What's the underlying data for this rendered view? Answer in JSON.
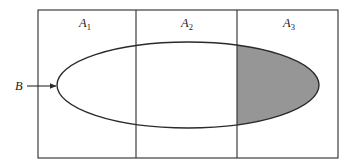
{
  "figure": {
    "type": "venn-partition-diagram",
    "background_color": "#ffffff",
    "stroke_color": "#2b2b2b",
    "shaded_color": "#969696"
  },
  "universe_rect": {
    "name": "universal-set-rectangle",
    "x": 38,
    "y": 10,
    "width": 300,
    "height": 148
  },
  "partitions": [
    {
      "id": "A1",
      "label": "A",
      "subscript": "1",
      "label_x": 85,
      "label_y": 27,
      "region_x": 38,
      "region_width": 98
    },
    {
      "id": "A2",
      "label": "A",
      "subscript": "2",
      "label_x": 187,
      "label_y": 27,
      "region_x": 136,
      "region_width": 101
    },
    {
      "id": "A3",
      "label": "A",
      "subscript": "3",
      "label_x": 289,
      "label_y": 27,
      "region_x": 237,
      "region_width": 101
    }
  ],
  "dividers": [
    {
      "name": "divider-A1-A2",
      "x": 136
    },
    {
      "name": "divider-A2-A3",
      "x": 237
    }
  ],
  "ellipse": {
    "name": "set-B-ellipse",
    "cx": 188,
    "cy": 85,
    "rx": 131,
    "ry": 43,
    "fill": "none"
  },
  "shaded_region": {
    "name": "intersection-B-A3",
    "description": "Portion of ellipse B lying to the right of divider at x=237",
    "clip_x_start": 237,
    "fill": "#969696"
  },
  "callout": {
    "name": "set-B-callout",
    "label": "B",
    "label_x": 15,
    "label_y": 90,
    "arrow_start_x": 27,
    "arrow_end_x": 56,
    "arrow_y": 86
  }
}
